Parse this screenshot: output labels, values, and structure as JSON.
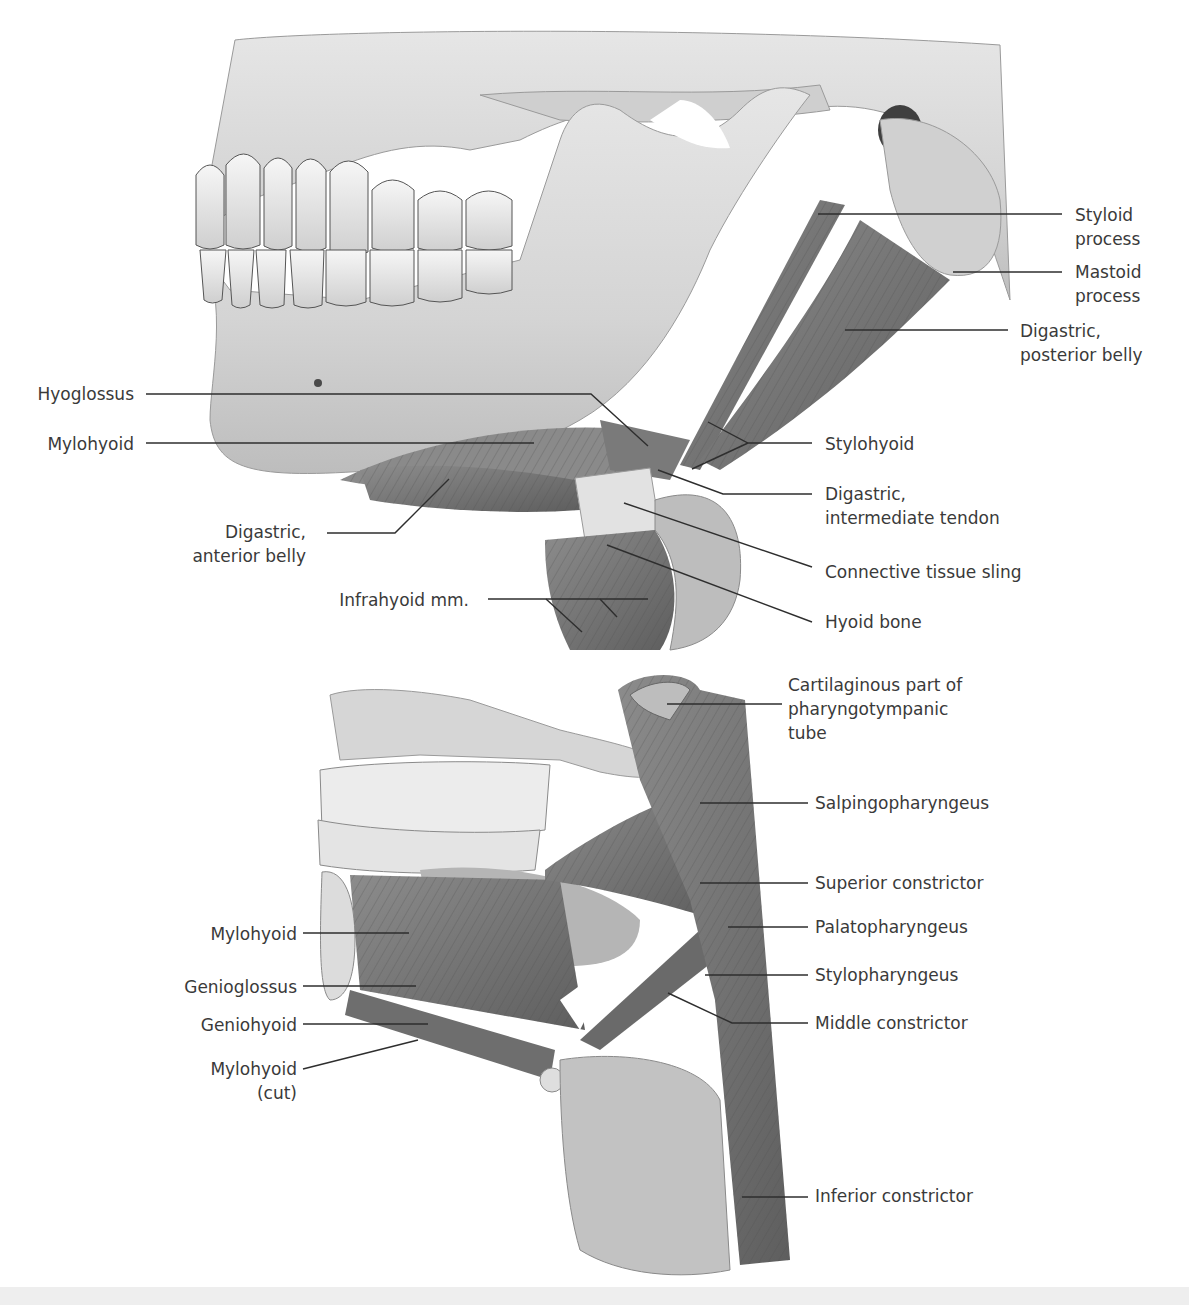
{
  "figure": {
    "top_panel": {
      "name": "Lateral view of mandible with suprahyoid muscles",
      "labels": [
        {
          "id": "styloid-process",
          "text": [
            "Styloid",
            "process"
          ],
          "x": 1075,
          "y": 203,
          "align": "left",
          "line": [
            [
              818,
              214
            ],
            [
              1062,
              214
            ]
          ]
        },
        {
          "id": "mastoid-process",
          "text": [
            "Mastoid",
            "process"
          ],
          "x": 1075,
          "y": 260,
          "align": "left",
          "line": [
            [
              953,
              272
            ],
            [
              1062,
              272
            ]
          ]
        },
        {
          "id": "digastric-posterior-belly",
          "text": [
            "Digastric,",
            "posterior belly"
          ],
          "x": 1020,
          "y": 319,
          "align": "left",
          "line": [
            [
              845,
              330
            ],
            [
              1008,
              330
            ]
          ]
        },
        {
          "id": "hyoglossus",
          "text": [
            "Hyoglossus"
          ],
          "x": 134,
          "y": 382,
          "align": "right",
          "line": [
            [
              146,
              394
            ],
            [
              591,
              394
            ],
            [
              648,
              446
            ]
          ]
        },
        {
          "id": "mylohyoid-top",
          "text": [
            "Mylohyoid"
          ],
          "x": 134,
          "y": 432,
          "align": "right",
          "line": [
            [
              146,
              443
            ],
            [
              534,
              443
            ]
          ]
        },
        {
          "id": "stylohyoid",
          "text": [
            "Stylohyoid"
          ],
          "x": 825,
          "y": 432,
          "align": "left",
          "line": [
            [
              708,
              422
            ],
            [
              748,
              443
            ],
            [
              812,
              443
            ],
            [
              748,
              443
            ],
            [
              692,
              469
            ]
          ]
        },
        {
          "id": "digastric-intermediate-tendon",
          "text": [
            "Digastric,",
            "intermediate tendon"
          ],
          "x": 825,
          "y": 482,
          "align": "left",
          "line": [
            [
              658,
              470
            ],
            [
              723,
              494
            ],
            [
              812,
              494
            ]
          ]
        },
        {
          "id": "digastric-anterior-belly",
          "text": [
            "Digastric,",
            "anterior belly"
          ],
          "x": 306,
          "y": 520,
          "align": "right",
          "line": [
            [
              327,
              533
            ],
            [
              395,
              533
            ],
            [
              449,
              479
            ]
          ]
        },
        {
          "id": "connective-tissue-sling",
          "text": [
            "Connective tissue sling"
          ],
          "x": 825,
          "y": 560,
          "align": "left",
          "line": [
            [
              624,
              503
            ],
            [
              812,
              567
            ]
          ]
        },
        {
          "id": "infrahyoid-mm",
          "text": [
            "Infrahyoid mm."
          ],
          "x": 330,
          "y": 590,
          "align": "right",
          "line": [
            [
              488,
              599
            ],
            [
              648,
              599
            ]
          ],
          "sublines": [
            [
              [
                546,
                599
              ],
              [
                582,
                632
              ]
            ],
            [
              [
                600,
                599
              ],
              [
                617,
                617
              ]
            ]
          ]
        },
        {
          "id": "hyoid-bone",
          "text": [
            "Hyoid bone"
          ],
          "x": 825,
          "y": 610,
          "align": "left",
          "line": [
            [
              607,
              545
            ],
            [
              812,
              622
            ]
          ]
        }
      ]
    },
    "bottom_panel": {
      "name": "Sagittal view of floor of mouth and pharyngeal muscles",
      "labels": [
        {
          "id": "cartilaginous-part-pharyngotympanic-tube",
          "text": [
            "Cartilaginous part of",
            "pharyngotympanic",
            "tube"
          ],
          "x": 788,
          "y": 673,
          "align": "left",
          "line": [
            [
              667,
              704
            ],
            [
              782,
              704
            ]
          ]
        },
        {
          "id": "salpingopharyngeus",
          "text": [
            "Salpingopharyngeus"
          ],
          "x": 815,
          "y": 791,
          "align": "left",
          "line": [
            [
              700,
              803
            ],
            [
              808,
              803
            ]
          ]
        },
        {
          "id": "superior-constrictor",
          "text": [
            "Superior constrictor"
          ],
          "x": 815,
          "y": 871,
          "align": "left",
          "line": [
            [
              700,
              883
            ],
            [
              808,
              883
            ]
          ]
        },
        {
          "id": "palatopharyngeus",
          "text": [
            "Palatopharyngeus"
          ],
          "x": 815,
          "y": 915,
          "align": "left",
          "line": [
            [
              728,
              927
            ],
            [
              808,
              927
            ]
          ]
        },
        {
          "id": "mylohyoid-bottom",
          "text": [
            "Mylohyoid"
          ],
          "x": 297,
          "y": 922,
          "align": "right",
          "line": [
            [
              303,
              933
            ],
            [
              409,
              933
            ]
          ]
        },
        {
          "id": "stylopharyngeus",
          "text": [
            "Stylopharyngeus"
          ],
          "x": 815,
          "y": 963,
          "align": "left",
          "line": [
            [
              705,
              975
            ],
            [
              808,
              975
            ]
          ]
        },
        {
          "id": "genioglossus",
          "text": [
            "Genioglossus"
          ],
          "x": 297,
          "y": 975,
          "align": "right",
          "line": [
            [
              303,
              986
            ],
            [
              416,
              986
            ]
          ]
        },
        {
          "id": "geniohyoid",
          "text": [
            "Geniohyoid"
          ],
          "x": 297,
          "y": 1013,
          "align": "right",
          "line": [
            [
              303,
              1024
            ],
            [
              428,
              1024
            ]
          ]
        },
        {
          "id": "middle-constrictor",
          "text": [
            "Middle constrictor"
          ],
          "x": 815,
          "y": 1011,
          "align": "left",
          "line": [
            [
              668,
              993
            ],
            [
              732,
              1023
            ],
            [
              808,
              1023
            ]
          ]
        },
        {
          "id": "mylohyoid-cut",
          "text": [
            "Mylohyoid",
            "(cut)"
          ],
          "x": 297,
          "y": 1055,
          "align": "right",
          "line": [
            [
              303,
              1069
            ],
            [
              418,
              1040
            ]
          ]
        },
        {
          "id": "inferior-constrictor",
          "text": [
            "Inferior constrictor"
          ],
          "x": 815,
          "y": 1184,
          "align": "left",
          "line": [
            [
              742,
              1197
            ],
            [
              808,
              1197
            ]
          ]
        }
      ]
    },
    "colors": {
      "bone": "#d9d9d9",
      "bone_shadow": "#a8a8a8",
      "tooth": "#efefef",
      "muscle": "#7e7e7e",
      "muscle_dark": "#5f5f5f",
      "cartilage": "#b9b9b9",
      "label_text": "#3a3a3a",
      "leader_line": "#2e2e2e",
      "bottom_band": "#eeeeee"
    }
  }
}
